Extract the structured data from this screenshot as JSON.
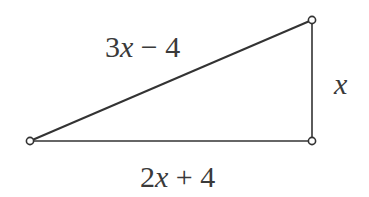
{
  "diagram": {
    "type": "right-triangle",
    "labels": {
      "hypotenuse": "3x − 4",
      "vertical_side": "x",
      "base": "2x + 4"
    },
    "hyp": {
      "n": "3",
      "v": "x",
      "op": " − 4"
    },
    "base": {
      "n": "2",
      "v": "x",
      "op": " + 4"
    },
    "vert": {
      "v": "x"
    },
    "vertices": [
      {
        "name": "left",
        "x": 30,
        "y": 141
      },
      {
        "name": "bottom-right",
        "x": 312,
        "y": 141
      },
      {
        "name": "top-right",
        "x": 312,
        "y": 20
      }
    ],
    "colors": {
      "stroke": "#333333",
      "text": "#3a3a3a",
      "background": "#ffffff"
    }
  }
}
